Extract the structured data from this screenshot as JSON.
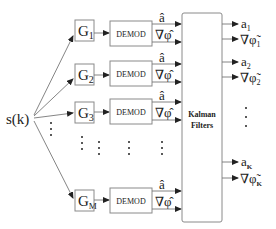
{
  "input": {
    "label": "s(k)"
  },
  "branches": [
    {
      "gain": "G",
      "gain_sub": "1",
      "demod": "DEMOD",
      "out_a": "â",
      "out_phi": "∇φ̂",
      "y": 28
    },
    {
      "gain": "G",
      "gain_sub": "2",
      "demod": "DEMOD",
      "out_a": "â",
      "out_phi": "∇φ̂",
      "y": 74
    },
    {
      "gain": "G",
      "gain_sub": "3",
      "demod": "DEMOD",
      "out_a": "â",
      "out_phi": "∇φ̂",
      "y": 112
    },
    {
      "gain": "G",
      "gain_sub": "M",
      "demod": "DEMOD",
      "out_a": "â",
      "out_phi": "∇φ̂",
      "y": 199
    }
  ],
  "kalman": {
    "line1": "Kalman",
    "line2": "Filters"
  },
  "outputs": [
    {
      "a": "a",
      "a_sub": "1",
      "phi": "∇φ̃",
      "phi_sub": "1"
    },
    {
      "a": "a",
      "a_sub": "2",
      "phi": "∇φ̃",
      "phi_sub": "2"
    },
    {
      "a": "a",
      "a_sub": "K",
      "phi": "∇φ̃",
      "phi_sub": "K"
    }
  ],
  "ellipsis": "⋮"
}
